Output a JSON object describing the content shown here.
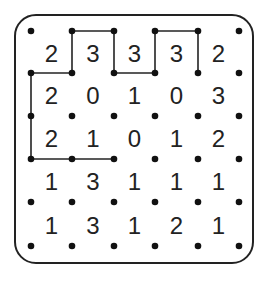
{
  "puzzle": {
    "type": "slitherlink",
    "rows": 5,
    "cols": 5,
    "clues": [
      [
        2,
        3,
        3,
        3,
        2
      ],
      [
        2,
        0,
        1,
        0,
        3
      ],
      [
        2,
        1,
        0,
        1,
        2
      ],
      [
        1,
        3,
        1,
        1,
        1
      ],
      [
        1,
        3,
        1,
        2,
        1
      ]
    ],
    "dot_x": [
      31,
      72,
      114,
      155,
      198,
      239
    ],
    "dot_y": [
      31,
      73,
      116,
      159,
      202,
      246
    ],
    "drawn_edges": [
      [
        [
          1,
          0
        ],
        [
          2,
          0
        ]
      ],
      [
        [
          1,
          0
        ],
        [
          1,
          1
        ]
      ],
      [
        [
          2,
          0
        ],
        [
          2,
          1
        ]
      ],
      [
        [
          2,
          1
        ],
        [
          3,
          1
        ]
      ],
      [
        [
          3,
          0
        ],
        [
          3,
          1
        ]
      ],
      [
        [
          3,
          0
        ],
        [
          4,
          0
        ]
      ],
      [
        [
          4,
          0
        ],
        [
          4,
          1
        ]
      ],
      [
        [
          0,
          1
        ],
        [
          1,
          1
        ]
      ],
      [
        [
          0,
          1
        ],
        [
          0,
          2
        ]
      ],
      [
        [
          0,
          2
        ],
        [
          0,
          3
        ]
      ],
      [
        [
          0,
          3
        ],
        [
          1,
          3
        ]
      ],
      [
        [
          1,
          3
        ],
        [
          2,
          3
        ]
      ]
    ],
    "colors": {
      "line": "#222222",
      "dot": "#111111",
      "text": "#222222",
      "border": "#222222"
    }
  }
}
